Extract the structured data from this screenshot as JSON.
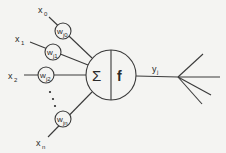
{
  "diagram": {
    "inputs": [
      {
        "label": "x",
        "sub": "0",
        "weight": "w",
        "weight_sub": "j0"
      },
      {
        "label": "x",
        "sub": "1",
        "weight": "w",
        "weight_sub": "j1"
      },
      {
        "label": "x",
        "sub": "2",
        "weight": "w",
        "weight_sub": "j2"
      },
      {
        "label": "x",
        "sub": "n",
        "weight": "w",
        "weight_sub": "jn"
      }
    ],
    "ellipsis": "⋮",
    "neuron": {
      "sum_symbol": "Σ",
      "activation": "f"
    },
    "output": {
      "label": "y",
      "sub": "j"
    },
    "colors": {
      "stroke": "#3a3a3a",
      "background": "#f4f4f2"
    }
  }
}
